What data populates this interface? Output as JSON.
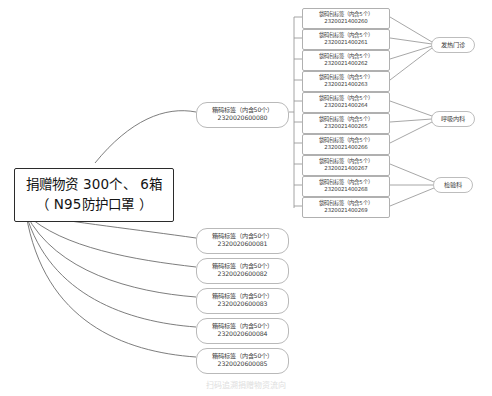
{
  "diagram": {
    "type": "mind-map",
    "title_node": {
      "line1": "捐赠物资  300个、 6箱",
      "line2": "（ N95防护口罩 ）"
    },
    "colors": {
      "root_border": "#2b2b2b",
      "node_border": "#b9b9b9",
      "edge": "#6e6e6e",
      "trunk": "#9a9a9a",
      "text": "#1a1a1a",
      "background": "#ffffff"
    },
    "box_nodes": [
      {
        "label": "箱码标签（内含50个）",
        "code": "2320020600080"
      },
      {
        "label": "箱码标签（内含50个）",
        "code": "2320020600081"
      },
      {
        "label": "箱码标签（内含50个）",
        "code": "2320020600082"
      },
      {
        "label": "箱码标签（内含50个）",
        "code": "2320020600083"
      },
      {
        "label": "箱码标签（内含50个）",
        "code": "2320020600084"
      },
      {
        "label": "箱码标签（内含50个）",
        "code": "2320020600085"
      }
    ],
    "bag_nodes": [
      {
        "label": "袋码包标签（内含5个）",
        "code": "2320021400260"
      },
      {
        "label": "袋码包标签（内含5个）",
        "code": "2320021400261"
      },
      {
        "label": "袋码包标签（内含5个）",
        "code": "2320021400262"
      },
      {
        "label": "袋码包标签（内含5个）",
        "code": "2320021400263"
      },
      {
        "label": "袋码包标签（内含5个）",
        "code": "2320021400264"
      },
      {
        "label": "袋码包标签（内含5个）",
        "code": "2320021400265"
      },
      {
        "label": "袋码包标签（内含5个）",
        "code": "2320021400266"
      },
      {
        "label": "袋码包标签（内含5个）",
        "code": "2320021400267"
      },
      {
        "label": "袋码包标签（内含5个）",
        "code": "2320021400268"
      },
      {
        "label": "袋码包标签（内含5个）",
        "code": "2320021400269"
      }
    ],
    "department_nodes": [
      {
        "label": "发热门诊"
      },
      {
        "label": "呼吸内科"
      },
      {
        "label": "检验科"
      }
    ],
    "bottom_caption": "扫码追溯捐赠物资流向"
  }
}
